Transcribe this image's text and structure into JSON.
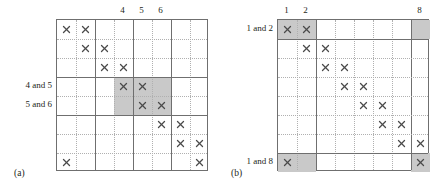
{
  "figure": {
    "panels": [
      {
        "id": "a",
        "caption": "(a)",
        "grid": {
          "rows": 8,
          "cols": 8
        },
        "column_labels": [
          {
            "col": 4,
            "text": "4"
          },
          {
            "col": 5,
            "text": "5"
          },
          {
            "col": 6,
            "text": "6"
          }
        ],
        "row_labels": [
          {
            "row": 4,
            "text": "4 and 5"
          },
          {
            "row": 5,
            "text": "5 and 6"
          }
        ],
        "marks": [
          {
            "row": 1,
            "col": 1
          },
          {
            "row": 1,
            "col": 2
          },
          {
            "row": 2,
            "col": 2
          },
          {
            "row": 2,
            "col": 3
          },
          {
            "row": 3,
            "col": 3
          },
          {
            "row": 3,
            "col": 4
          },
          {
            "row": 4,
            "col": 4
          },
          {
            "row": 4,
            "col": 5
          },
          {
            "row": 5,
            "col": 5
          },
          {
            "row": 5,
            "col": 6
          },
          {
            "row": 6,
            "col": 6
          },
          {
            "row": 6,
            "col": 7
          },
          {
            "row": 7,
            "col": 7
          },
          {
            "row": 7,
            "col": 8
          },
          {
            "row": 8,
            "col": 1
          },
          {
            "row": 8,
            "col": 8
          }
        ],
        "shaded_cells": [
          {
            "row": 4,
            "col": 4
          },
          {
            "row": 4,
            "col": 5
          },
          {
            "row": 4,
            "col": 6
          },
          {
            "row": 5,
            "col": 4
          },
          {
            "row": 5,
            "col": 5
          },
          {
            "row": 5,
            "col": 6
          }
        ],
        "major_vlines": [
          2,
          4,
          6
        ],
        "major_hlines": [
          3,
          5
        ]
      },
      {
        "id": "b",
        "caption": "(b)",
        "grid": {
          "rows": 8,
          "cols": 8
        },
        "column_labels": [
          {
            "col": 1,
            "text": "1"
          },
          {
            "col": 2,
            "text": "2"
          },
          {
            "col": 8,
            "text": "8"
          }
        ],
        "row_labels": [
          {
            "row": 1,
            "text": "1 and 2"
          },
          {
            "row": 8,
            "text": "1 and 8"
          }
        ],
        "marks": [
          {
            "row": 1,
            "col": 1
          },
          {
            "row": 1,
            "col": 2
          },
          {
            "row": 2,
            "col": 2
          },
          {
            "row": 2,
            "col": 3
          },
          {
            "row": 3,
            "col": 3
          },
          {
            "row": 3,
            "col": 4
          },
          {
            "row": 4,
            "col": 4
          },
          {
            "row": 4,
            "col": 5
          },
          {
            "row": 5,
            "col": 5
          },
          {
            "row": 5,
            "col": 6
          },
          {
            "row": 6,
            "col": 6
          },
          {
            "row": 6,
            "col": 7
          },
          {
            "row": 7,
            "col": 7
          },
          {
            "row": 7,
            "col": 8
          },
          {
            "row": 8,
            "col": 1
          },
          {
            "row": 8,
            "col": 8
          }
        ],
        "shaded_cells": [
          {
            "row": 1,
            "col": 1
          },
          {
            "row": 1,
            "col": 2
          },
          {
            "row": 1,
            "col": 8
          },
          {
            "row": 8,
            "col": 1
          },
          {
            "row": 8,
            "col": 2
          },
          {
            "row": 8,
            "col": 8
          }
        ],
        "major_vlines": [
          2,
          7
        ],
        "major_hlines": [
          1,
          7
        ]
      }
    ],
    "colors": {
      "shade": "#c9c9c9",
      "grid_major": "#6f6f6f",
      "grid_minor": "#b0b0b0",
      "mark": "#4a4a4a",
      "text": "#231f20",
      "background": "#ffffff"
    },
    "mark_glyph": "x-mark-icon"
  }
}
